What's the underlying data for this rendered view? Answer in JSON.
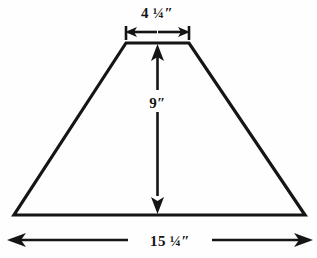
{
  "figure": {
    "type": "trapezoid-dimension-diagram",
    "background_color": "#fefefe",
    "line_color": "#151515",
    "line_width": 3
  },
  "shape": {
    "name": "trapezoid",
    "vertices": {
      "top_left": [
        126,
        43
      ],
      "top_right": [
        189,
        43
      ],
      "bottom_right": [
        305,
        215
      ],
      "bottom_left": [
        14,
        215
      ]
    }
  },
  "dimensions": {
    "top_width": {
      "label": "4 ¼″",
      "value": 4.25,
      "unit": "inches",
      "orientation": "horizontal",
      "position": "top"
    },
    "height": {
      "label": "9″",
      "value": 9,
      "unit": "inches",
      "orientation": "vertical",
      "position": "center"
    },
    "bottom_width": {
      "label": "15 ¼″",
      "value": 15.25,
      "unit": "inches",
      "orientation": "horizontal",
      "position": "bottom"
    }
  }
}
